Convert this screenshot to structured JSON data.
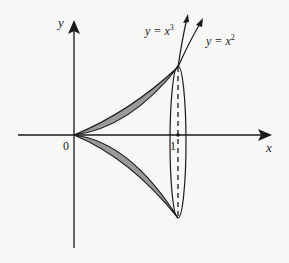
{
  "diagram": {
    "axes": {
      "x_label": "x",
      "y_label": "y",
      "origin_label": "0",
      "tick_label": "1"
    },
    "curves": [
      {
        "name": "cubic",
        "label_prefix": "y = x",
        "exponent": "3"
      },
      {
        "name": "square",
        "label_prefix": "y = x",
        "exponent": "2"
      }
    ],
    "colors": {
      "fill": "#9a9a9a",
      "stroke": "#1a1a1a",
      "background": "#f7f7f5"
    }
  }
}
